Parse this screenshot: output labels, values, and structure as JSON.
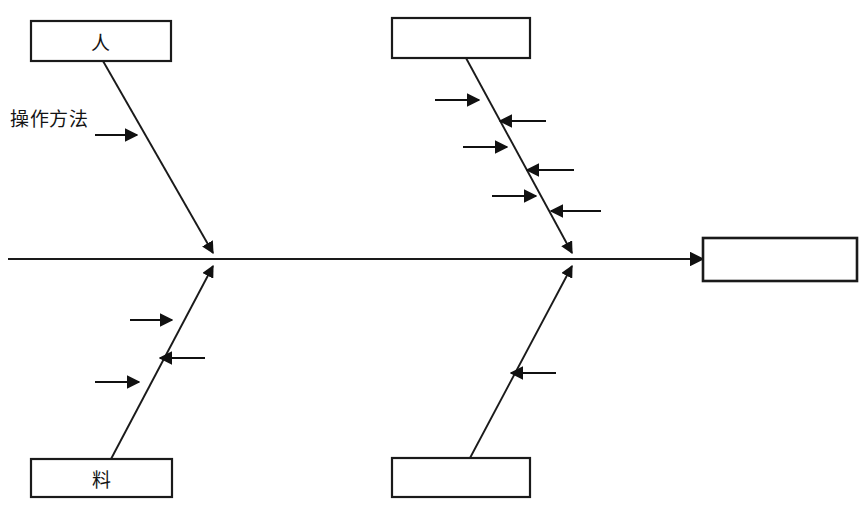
{
  "diagram": {
    "type": "fishbone-ishikawa",
    "title": "",
    "canvas": {
      "width": 867,
      "height": 512
    },
    "spine": {
      "name": "main-spine",
      "x1": 8,
      "y1": 259,
      "x2": 703,
      "y2": 259,
      "arrowhead": "right"
    },
    "effect_box": {
      "name": "effect-box",
      "label": "",
      "x": 703,
      "y": 238,
      "width": 154,
      "height": 43
    },
    "category_boxes": [
      {
        "key": "top-left",
        "label": "人",
        "x": 31,
        "y": 21,
        "width": 140,
        "height": 40
      },
      {
        "key": "top-middle",
        "label": "",
        "x": 392,
        "y": 18,
        "width": 138,
        "height": 40
      },
      {
        "key": "bottom-left",
        "label": "料",
        "x": 31,
        "y": 459,
        "width": 141,
        "height": 38
      },
      {
        "key": "bottom-middle",
        "label": "",
        "x": 392,
        "y": 458,
        "width": 138,
        "height": 39
      }
    ],
    "branches": [
      {
        "key": "upper-left-branch",
        "from_x": 103,
        "from_y": 61,
        "to_x": 213,
        "to_y": 252,
        "arrowhead": true
      },
      {
        "key": "lower-left-branch",
        "from_x": 111,
        "from_y": 459,
        "to_x": 213,
        "to_y": 266,
        "arrowhead": true
      },
      {
        "key": "upper-right-branch",
        "from_x": 466,
        "from_y": 58,
        "to_x": 572,
        "to_y": 252,
        "arrowhead": true
      },
      {
        "key": "lower-right-branch",
        "from_x": 470,
        "from_y": 458,
        "to_x": 572,
        "to_y": 266,
        "arrowhead": true
      }
    ],
    "cause_arrows": [
      {
        "key": "ul-cause-1",
        "branch": "upper-left-branch",
        "direction": "right",
        "tail_x": 95,
        "tip_x": 137,
        "y": 135
      },
      {
        "key": "ll-cause-1",
        "branch": "lower-left-branch",
        "direction": "right",
        "tail_x": 130,
        "tip_x": 172,
        "y": 320
      },
      {
        "key": "ll-cause-2",
        "branch": "lower-left-branch",
        "direction": "left",
        "tail_x": 205,
        "tip_x": 160,
        "y": 358
      },
      {
        "key": "ll-cause-3",
        "branch": "lower-left-branch",
        "direction": "right",
        "tail_x": 95,
        "tip_x": 139,
        "y": 382
      },
      {
        "key": "ur-cause-1",
        "branch": "upper-right-branch",
        "direction": "right",
        "tail_x": 435,
        "tip_x": 479,
        "y": 100
      },
      {
        "key": "ur-cause-2",
        "branch": "upper-right-branch",
        "direction": "left",
        "tail_x": 546,
        "tip_x": 500,
        "y": 121
      },
      {
        "key": "ur-cause-3",
        "branch": "upper-right-branch",
        "direction": "right",
        "tail_x": 463,
        "tip_x": 507,
        "y": 147
      },
      {
        "key": "ur-cause-4",
        "branch": "upper-right-branch",
        "direction": "left",
        "tail_x": 574,
        "tip_x": 527,
        "y": 170
      },
      {
        "key": "ur-cause-5",
        "branch": "upper-right-branch",
        "direction": "right",
        "tail_x": 492,
        "tip_x": 536,
        "y": 196
      },
      {
        "key": "ur-cause-6",
        "branch": "upper-right-branch",
        "direction": "left",
        "tail_x": 601,
        "tip_x": 551,
        "y": 211
      },
      {
        "key": "lr-cause-1",
        "branch": "lower-right-branch",
        "direction": "left",
        "tail_x": 556,
        "tip_x": 511,
        "y": 373
      }
    ],
    "free_labels": [
      {
        "key": "operation-method-label",
        "text": "操作方法",
        "x": 10,
        "y": 104
      }
    ],
    "colors": {
      "stroke": "#1a1a1a",
      "text": "#141414",
      "background": "#ffffff"
    }
  }
}
